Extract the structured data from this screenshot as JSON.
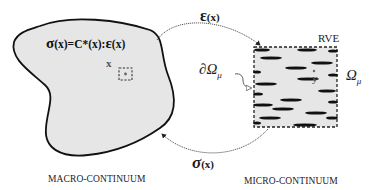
{
  "macro": {
    "formula_sigma": "σ",
    "formula_rest": "(x)=C*(x):",
    "formula_eps": "ε",
    "formula_end": "(x)",
    "point_label": "x",
    "caption": "MACRO-CONTINUUM",
    "fill_color": "#e6e6e6",
    "stroke_color": "#111111"
  },
  "arrows": {
    "top_symbol": "ε",
    "top_arg": "(x)",
    "bottom_symbol": "σ",
    "bottom_arg": "(x)"
  },
  "micro": {
    "rve_label": "RVE",
    "boundary_label": "∂Ω",
    "boundary_sub": "μ",
    "domain_label": "Ω",
    "domain_sub": "μ",
    "point_label": "y",
    "caption": "MICRO-CONTINUUM",
    "fill_color": "#e6e6e6",
    "inclusions": [
      {
        "cx": 262,
        "cy": 50,
        "rx": 8,
        "ry": 1.6
      },
      {
        "cx": 307,
        "cy": 50,
        "rx": 10,
        "ry": 1.6
      },
      {
        "cx": 333,
        "cy": 51,
        "rx": 5,
        "ry": 1.6
      },
      {
        "cx": 271,
        "cy": 58,
        "rx": 11,
        "ry": 1.6
      },
      {
        "cx": 322,
        "cy": 63,
        "rx": 11,
        "ry": 1.6
      },
      {
        "cx": 296,
        "cy": 68,
        "rx": 11,
        "ry": 1.6
      },
      {
        "cx": 257,
        "cy": 72,
        "rx": 4,
        "ry": 1.6
      },
      {
        "cx": 308,
        "cy": 79,
        "rx": 11,
        "ry": 1.6
      },
      {
        "cx": 333,
        "cy": 75,
        "rx": 5,
        "ry": 1.6
      },
      {
        "cx": 266,
        "cy": 84,
        "rx": 11,
        "ry": 1.6
      },
      {
        "cx": 327,
        "cy": 91,
        "rx": 9,
        "ry": 1.6
      },
      {
        "cx": 258,
        "cy": 94,
        "rx": 5,
        "ry": 1.6
      },
      {
        "cx": 291,
        "cy": 100,
        "rx": 11,
        "ry": 1.6
      },
      {
        "cx": 333,
        "cy": 102,
        "rx": 5,
        "ry": 1.6
      },
      {
        "cx": 263,
        "cy": 105,
        "rx": 10,
        "ry": 1.6
      },
      {
        "cx": 283,
        "cy": 109,
        "rx": 11,
        "ry": 1.6
      },
      {
        "cx": 316,
        "cy": 113,
        "rx": 11,
        "ry": 1.6
      },
      {
        "cx": 270,
        "cy": 118,
        "rx": 11,
        "ry": 1.6
      },
      {
        "cx": 332,
        "cy": 118,
        "rx": 6,
        "ry": 1.6
      },
      {
        "cx": 257,
        "cy": 123,
        "rx": 4,
        "ry": 1.6
      },
      {
        "cx": 305,
        "cy": 125,
        "rx": 12,
        "ry": 1.6
      }
    ]
  }
}
